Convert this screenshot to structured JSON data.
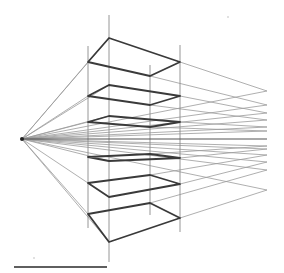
{
  "diagram": {
    "title": "",
    "type": "one-point perspective study",
    "colors": {
      "background": "#ffffff",
      "construction_line": "#9a9a9a",
      "vertical_guide": "#8a8a8a",
      "plane_edge": "#3a3a3a",
      "horizon": "#555555",
      "scale_bar": "#2a2a2a"
    },
    "vanishing_point": {
      "x": 22,
      "y": 139
    },
    "horizon_end_x": 267,
    "verticals": [
      {
        "x": 88,
        "y1": 46,
        "y2": 228
      },
      {
        "x": 109,
        "y1": 15,
        "y2": 262
      },
      {
        "x": 150,
        "y1": 65,
        "y2": 215
      },
      {
        "x": 180,
        "y1": 45,
        "y2": 232
      }
    ],
    "planes": [
      {
        "points": "109,38 180,62 150,76 88,62"
      },
      {
        "points": "109,85 180,96 150,105 88,96"
      },
      {
        "points": "109,116 180,122 150,127 88,122"
      },
      {
        "points": "88,157 150,154 180,158 109,161"
      },
      {
        "points": "88,183 150,175 180,184 109,197"
      },
      {
        "points": "88,214 150,203 180,218 109,242"
      }
    ],
    "rays_to_edge": [
      91,
      105,
      113,
      120,
      127,
      131,
      146,
      149,
      155,
      162,
      170,
      190
    ],
    "rays_to_points": [
      {
        "x": 109,
        "y": 38
      },
      {
        "x": 88,
        "y": 62
      },
      {
        "x": 109,
        "y": 85
      },
      {
        "x": 88,
        "y": 96
      },
      {
        "x": 109,
        "y": 116
      },
      {
        "x": 88,
        "y": 122
      },
      {
        "x": 109,
        "y": 161
      },
      {
        "x": 88,
        "y": 183
      },
      {
        "x": 88,
        "y": 214
      },
      {
        "x": 109,
        "y": 242
      }
    ],
    "scale_bar": {
      "x1": 14,
      "x2": 107,
      "y": 267
    },
    "specks": [
      {
        "x": 34,
        "y": 258
      },
      {
        "x": 228,
        "y": 17
      }
    ]
  }
}
